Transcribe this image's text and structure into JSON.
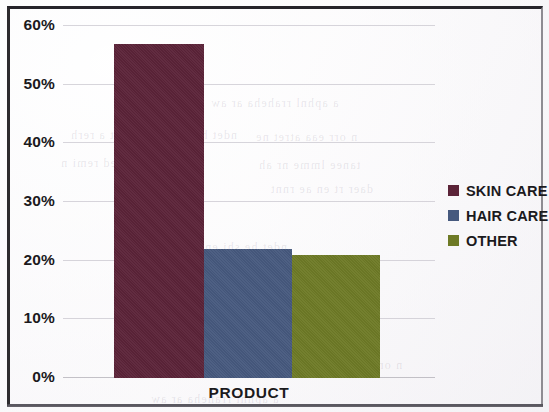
{
  "chart_data": {
    "type": "bar",
    "title": "",
    "xlabel": "PRODUCT",
    "ylabel": "",
    "categories": [
      "SKIN CARE",
      "HAIR CARE",
      "OTHER"
    ],
    "values": [
      57,
      22,
      21
    ],
    "value_unit": "%",
    "ylim": [
      0,
      60
    ],
    "y_ticks": [
      0,
      10,
      20,
      30,
      40,
      50,
      60
    ],
    "y_tick_labels": [
      "0%",
      "10%",
      "20%",
      "30%",
      "40%",
      "50%",
      "60%"
    ],
    "grid": true,
    "legend_position": "right",
    "series": [
      {
        "name": "SKIN CARE",
        "value": 57,
        "color": "#5b2338"
      },
      {
        "name": "HAIR CARE",
        "value": 22,
        "color": "#46597e"
      },
      {
        "name": "OTHER",
        "value": 21,
        "color": "#6e7a26"
      }
    ]
  },
  "axis": {
    "x_title": "PRODUCT",
    "y_tick_labels": [
      "60%",
      "50%",
      "40%",
      "30%",
      "20%",
      "10%",
      "0%"
    ]
  },
  "legend": {
    "items": [
      {
        "label": "SKIN CARE",
        "color": "#5b2338"
      },
      {
        "label": "HAIR CARE",
        "color": "#46597e"
      },
      {
        "label": "OTHER",
        "color": "#6e7a26"
      }
    ]
  },
  "colors": {
    "skin_care": "#5b2338",
    "hair_care": "#46597e",
    "other": "#6e7a26",
    "grid": "#c9c7cf",
    "text": "#1b1a1d",
    "frame": "#2d2b2e",
    "background": "#fbfafb"
  },
  "background_bleed": [
    "a aphnl rraheha ar aw",
    "ndet he shi en ate nnt a rerh",
    "n orr eaa atret ne",
    "aw ehtt ned remi n",
    "tanee lmme nr ah",
    "daer rt en ae rnnt"
  ]
}
